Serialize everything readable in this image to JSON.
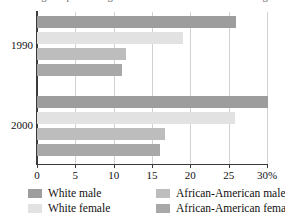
{
  "chart_data": {
    "type": "bar",
    "orientation": "horizontal",
    "title": "Percentage of persons age 25 and over with a bachelor's degree",
    "xlabel": "",
    "ylabel": "",
    "categories": [
      "1990",
      "2000"
    ],
    "xlim": [
      0,
      30
    ],
    "x_unit": "%",
    "grid": true,
    "legend_position": "bottom",
    "xticks": [
      {
        "value": 0,
        "label": "0"
      },
      {
        "value": 5,
        "label": "5"
      },
      {
        "value": 10,
        "label": "10"
      },
      {
        "value": 15,
        "label": "15"
      },
      {
        "value": 20,
        "label": "20"
      },
      {
        "value": 25,
        "label": "25"
      },
      {
        "value": 30,
        "label": "30%"
      }
    ],
    "series": [
      {
        "name": "White male",
        "color": "#9d9d9d",
        "values": [
          25.9,
          30.1
        ]
      },
      {
        "name": "White female",
        "color": "#e2e2e2",
        "values": [
          19.0,
          25.8
        ]
      },
      {
        "name": "African-American male",
        "color": "#bdbdbd",
        "values": [
          11.6,
          16.7
        ]
      },
      {
        "name": "African-American female",
        "color": "#a8a8a8",
        "values": [
          11.1,
          16.0
        ]
      }
    ]
  },
  "legend": {
    "columns": [
      {
        "entries": [
          0,
          1
        ]
      },
      {
        "entries": [
          2,
          3
        ]
      }
    ]
  },
  "axis": {
    "axis_color": "#3a3a3a",
    "grid_color": "#d2d2d2"
  }
}
